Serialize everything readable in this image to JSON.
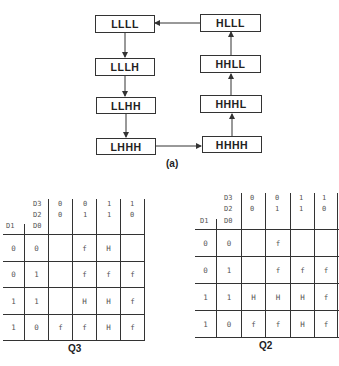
{
  "state_diagram": {
    "caption": "(a)",
    "states": [
      {
        "id": "LLLL",
        "label": "LLLL"
      },
      {
        "id": "LLLH",
        "label": "LLLH"
      },
      {
        "id": "LLHH",
        "label": "LLHH"
      },
      {
        "id": "LHHH",
        "label": "LHHH"
      },
      {
        "id": "HHHH",
        "label": "HHHH"
      },
      {
        "id": "HHHL",
        "label": "HHHL"
      },
      {
        "id": "HHLL",
        "label": "HHLL"
      },
      {
        "id": "HLLL",
        "label": "HLLL"
      }
    ],
    "transitions": [
      [
        "LLLL",
        "LLLH"
      ],
      [
        "LLLH",
        "LLHH"
      ],
      [
        "LLHH",
        "LHHH"
      ],
      [
        "LHHH",
        "HHHH"
      ],
      [
        "HHHH",
        "HHHL"
      ],
      [
        "HHHL",
        "HHLL"
      ],
      [
        "HHLL",
        "HLLL"
      ],
      [
        "HLLL",
        "LLLL"
      ]
    ]
  },
  "kmaps": [
    {
      "title": "Q3",
      "col_var_top": "D3",
      "col_var_bottom": "D2",
      "row_var_left": "D1",
      "row_var_right": "D0",
      "col_headers": [
        {
          "d3": "0",
          "d2": "0"
        },
        {
          "d3": "0",
          "d2": "1"
        },
        {
          "d3": "1",
          "d2": "1"
        },
        {
          "d3": "1",
          "d2": "0"
        }
      ],
      "rows": [
        {
          "d1": "0",
          "d0": "0",
          "cells": [
            "",
            "f",
            "H",
            ""
          ]
        },
        {
          "d1": "0",
          "d0": "1",
          "cells": [
            "",
            "f",
            "f",
            "f"
          ]
        },
        {
          "d1": "1",
          "d0": "1",
          "cells": [
            "",
            "H",
            "H",
            "f"
          ]
        },
        {
          "d1": "1",
          "d0": "0",
          "cells": [
            "f",
            "f",
            "H",
            "f"
          ]
        }
      ]
    },
    {
      "title": "Q2",
      "col_var_top": "D3",
      "col_var_bottom": "D2",
      "row_var_left": "D1",
      "row_var_right": "D0",
      "col_headers": [
        {
          "d3": "0",
          "d2": "0"
        },
        {
          "d3": "0",
          "d2": "1"
        },
        {
          "d3": "1",
          "d2": "1"
        },
        {
          "d3": "1",
          "d2": "0"
        }
      ],
      "rows": [
        {
          "d1": "0",
          "d0": "0",
          "cells": [
            "",
            "f",
            "",
            ""
          ]
        },
        {
          "d1": "0",
          "d0": "1",
          "cells": [
            "",
            "f",
            "f",
            "f"
          ]
        },
        {
          "d1": "1",
          "d0": "1",
          "cells": [
            "H",
            "H",
            "H",
            "f"
          ]
        },
        {
          "d1": "1",
          "d0": "0",
          "cells": [
            "f",
            "f",
            "H",
            "f"
          ]
        }
      ]
    }
  ]
}
